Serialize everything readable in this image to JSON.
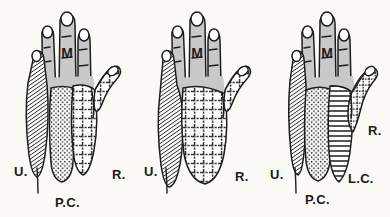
{
  "figure": {
    "background_color": "#fbfaf7",
    "ink_color": "#1d1d1d",
    "finger_fill_color": "#c9c9c9",
    "panel_count": 3
  },
  "legend_keys": {
    "U": "U.",
    "R": "R.",
    "PC": "P.C.",
    "LC": "L.C.",
    "M": "M"
  },
  "panels": [
    {
      "id": "panel-left",
      "index": 1,
      "median_label": "M",
      "regions": [
        {
          "key": "U",
          "label": "U.",
          "pattern": "diagonal-hatch",
          "label_x": 14,
          "label_y": 165
        },
        {
          "key": "PC",
          "label": "P.C.",
          "pattern": "stipple-dots",
          "label_x": 55,
          "label_y": 196
        },
        {
          "key": "R",
          "label": "R.",
          "pattern": "cross-hatch",
          "label_x": 112,
          "label_y": 168
        }
      ]
    },
    {
      "id": "panel-middle",
      "index": 2,
      "median_label": "M",
      "regions": [
        {
          "key": "U",
          "label": "U.",
          "pattern": "diagonal-hatch",
          "label_x": 14,
          "label_y": 165
        },
        {
          "key": "R",
          "label": "R.",
          "pattern": "cross-hatch",
          "label_x": 105,
          "label_y": 170
        }
      ]
    },
    {
      "id": "panel-right",
      "index": 3,
      "median_label": "M",
      "regions": [
        {
          "key": "U",
          "label": "U.",
          "pattern": "diagonal-hatch",
          "label_x": 10,
          "label_y": 168
        },
        {
          "key": "PC",
          "label": "P.C.",
          "pattern": "stipple-dots",
          "label_x": 45,
          "label_y": 193
        },
        {
          "key": "LC",
          "label": "L.C.",
          "pattern": "horizontal-line",
          "label_x": 88,
          "label_y": 172
        },
        {
          "key": "R",
          "label": "R.",
          "pattern": "cross-hatch",
          "label_x": 108,
          "label_y": 124
        }
      ]
    }
  ]
}
